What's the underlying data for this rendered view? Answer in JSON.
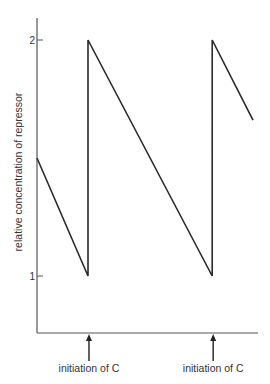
{
  "chart_data": {
    "type": "line",
    "title": "",
    "xlabel": "",
    "ylabel": "relative concentration of repressor",
    "grid": false,
    "ylim": [
      0.25,
      2.4
    ],
    "xlim": [
      0,
      1.0
    ],
    "y_ticks": [
      {
        "value": 1,
        "label": "1"
      },
      {
        "value": 2,
        "label": "2"
      }
    ],
    "series": [
      {
        "name": "repressor",
        "x": [
          0.0,
          0.236,
          0.236,
          0.811,
          0.811,
          1.0
        ],
        "y": [
          1.5,
          1.0,
          2.0,
          1.0,
          2.0,
          1.66
        ]
      }
    ],
    "annotations": [
      {
        "x": 0.236,
        "text": "initiation of C",
        "kind": "up-arrow-below-axis"
      },
      {
        "x": 0.811,
        "text": "initiation of C",
        "kind": "up-arrow-below-axis"
      }
    ]
  }
}
